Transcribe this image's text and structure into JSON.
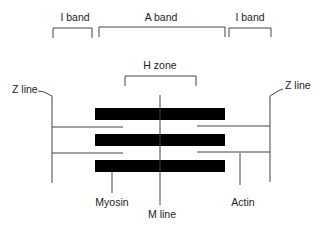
{
  "diagram": {
    "labels": {
      "i_band_left": "I band",
      "a_band": "A band",
      "i_band_right": "I band",
      "h_zone": "H zone",
      "z_line_left": "Z line",
      "z_line_right": "Z line",
      "myosin": "Myosin",
      "m_line": "M line",
      "actin": "Actin"
    },
    "colors": {
      "thick_filament": "#000000",
      "line": "#444444",
      "text": "#222222",
      "background": "#ffffff"
    }
  }
}
